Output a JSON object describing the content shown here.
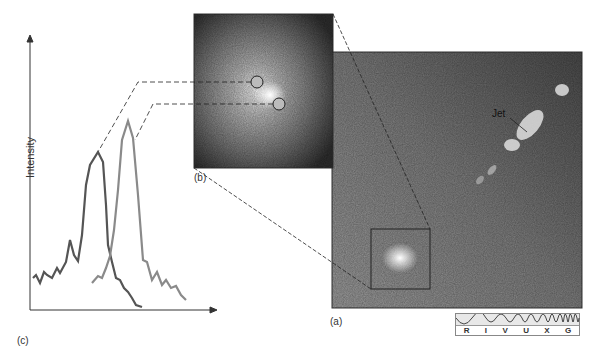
{
  "figure": {
    "panels": {
      "a": {
        "label": "(a)",
        "jet_label": "Jet"
      },
      "b": {
        "label": "(b)"
      },
      "c": {
        "label": "(c)",
        "ylabel": "Intensity"
      }
    },
    "spectrum_bar": {
      "bands": [
        "R",
        "I",
        "V",
        "U",
        "X",
        "G"
      ]
    }
  },
  "colors": {
    "curve_dark": "#555555",
    "curve_light": "#8a8a8a",
    "axis": "#333333"
  }
}
